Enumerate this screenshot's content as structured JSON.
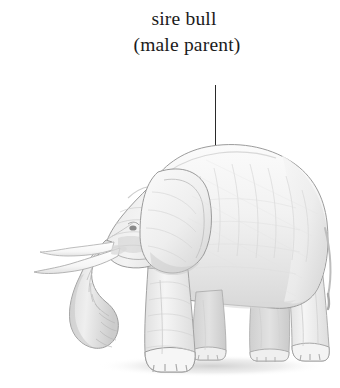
{
  "figure": {
    "style": "pencil-illustration",
    "background_color": "#ffffff"
  },
  "caption": {
    "line1": "sire bull",
    "line2": "(male parent)",
    "color": "#1b1b1b"
  },
  "leader_line": {
    "color": "#2a2a2a",
    "orientation": "vertical",
    "points_to": "elephant-back-shoulder"
  },
  "illustration": {
    "label": "adult male african elephant in left profile",
    "parts": [
      "trunk",
      "tusks",
      "ear",
      "head",
      "back",
      "rump",
      "tail",
      "front-legs",
      "hind-legs",
      "feet",
      "ground-shadow"
    ],
    "palette": {
      "outline": "#8d8d8d",
      "shadow_dark": "#9a9a9a",
      "shadow_mid": "#c5c5c5",
      "shadow_light": "#e4e4e4",
      "body_fill": "#f7f7f7",
      "tusk_fill": "#fdfdfd",
      "ground_shadow": "#dcdcdc"
    }
  }
}
